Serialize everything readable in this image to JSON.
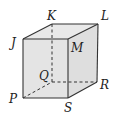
{
  "diagram": {
    "type": "rectangular-prism",
    "colors": {
      "edge": "#333333",
      "face": "#e6e6e6",
      "face_side": "#dadada",
      "label": "#222222"
    },
    "vertices": {
      "J": {
        "label": "J"
      },
      "K": {
        "label": "K"
      },
      "L": {
        "label": "L"
      },
      "M": {
        "label": "M"
      },
      "P": {
        "label": "P"
      },
      "Q": {
        "label": "Q"
      },
      "R": {
        "label": "R"
      },
      "S": {
        "label": "S"
      }
    },
    "hidden_edges": [
      "KQ",
      "PQ",
      "QR"
    ],
    "visible_edges": [
      "JK",
      "KL",
      "LM",
      "MJ",
      "JP",
      "PS",
      "SM",
      "SR",
      "RL"
    ]
  }
}
